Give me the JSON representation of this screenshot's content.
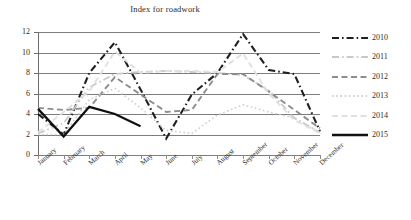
{
  "chart_data": {
    "type": "line",
    "title": "Index for roadwork",
    "xlabel": "",
    "ylabel": "",
    "ylim": [
      0,
      12
    ],
    "ytick_step": 2,
    "yticks": [
      0,
      2,
      4,
      6,
      8,
      10,
      12
    ],
    "grid": "horizontal",
    "legend_position": "right",
    "categories": [
      "January",
      "February",
      "March",
      "April",
      "May",
      "June",
      "July",
      "August",
      "September",
      "October",
      "November",
      "December"
    ],
    "series": [
      {
        "name": "2010",
        "color": "#1f1f1f",
        "dash": "dash-dot",
        "width": 2.1,
        "values": [
          4.0,
          2.0,
          8.0,
          11.0,
          6.4,
          1.6,
          5.9,
          8.0,
          11.8,
          8.3,
          7.9,
          2.3
        ]
      },
      {
        "name": "2011",
        "color": "#c9c9c9",
        "dash": "dash-dot",
        "width": 1.8,
        "values": [
          2.1,
          3.1,
          6.6,
          7.9,
          8.1,
          8.2,
          8.1,
          8.0,
          7.8,
          6.3,
          3.6,
          2.2
        ]
      },
      {
        "name": "2012",
        "color": "#8d8d8d",
        "dash": "dashed",
        "width": 1.9,
        "values": [
          4.6,
          4.4,
          4.6,
          7.6,
          5.9,
          4.2,
          4.4,
          7.9,
          7.9,
          6.2,
          4.4,
          2.6
        ]
      },
      {
        "name": "2013",
        "color": "#cfcfcf",
        "dash": "dotted",
        "width": 1.6,
        "values": [
          2.0,
          2.0,
          5.4,
          6.5,
          4.6,
          2.4,
          2.1,
          3.9,
          4.9,
          4.2,
          3.6,
          2.2
        ]
      },
      {
        "name": "2014",
        "color": "#e0e0e0",
        "dash": "dashed",
        "width": 1.9,
        "values": [
          2.2,
          4.2,
          6.2,
          10.1,
          8.0,
          8.2,
          8.2,
          8.1,
          9.9,
          6.0,
          3.4,
          2.1
        ]
      },
      {
        "name": "2015",
        "color": "#111111",
        "dash": "solid",
        "width": 2.3,
        "values": [
          4.5,
          1.8,
          4.7,
          4.0,
          2.8,
          null,
          null,
          null,
          null,
          null,
          null,
          null
        ]
      }
    ]
  },
  "legend": {
    "items": [
      {
        "label": "2010"
      },
      {
        "label": "2011"
      },
      {
        "label": "2012"
      },
      {
        "label": "2013"
      },
      {
        "label": "2014"
      },
      {
        "label": "2015"
      }
    ]
  }
}
